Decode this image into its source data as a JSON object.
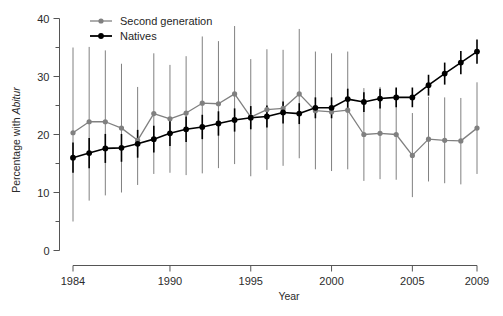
{
  "chart_data": {
    "type": "line",
    "title": "",
    "xlabel": "Year",
    "ylabel_prefix": "Percentage with ",
    "ylabel_italic": "Abitur",
    "xlim": [
      1983.2,
      2009.6
    ],
    "ylim": [
      0,
      40
    ],
    "grid": false,
    "legend_position": "top-left",
    "x_ticks": [
      1984,
      1990,
      1995,
      2000,
      2005,
      2009
    ],
    "x_tick_labels": [
      "1984",
      "1990",
      "1995",
      "2000",
      "2005",
      "2009"
    ],
    "y_ticks": [
      0,
      10,
      20,
      30,
      40
    ],
    "y_tick_labels": [
      "0",
      "10",
      "20",
      "30",
      "40"
    ],
    "y_minor_ticks": [
      5,
      15,
      25,
      35
    ],
    "x": [
      1984,
      1985,
      1986,
      1987,
      1988,
      1989,
      1990,
      1991,
      1992,
      1993,
      1994,
      1995,
      1996,
      1997,
      1998,
      1999,
      2000,
      2001,
      2002,
      2003,
      2004,
      2005,
      2006,
      2007,
      2008,
      2009
    ],
    "series": [
      {
        "name": "Second generation",
        "color": "#808080",
        "marker": "circle",
        "values": [
          20.3,
          22.2,
          22.2,
          21.1,
          19.0,
          23.6,
          22.7,
          23.7,
          25.4,
          25.3,
          27.0,
          23.0,
          24.3,
          24.5,
          27.0,
          24.1,
          23.9,
          24.2,
          20.0,
          20.2,
          20.0,
          16.4,
          19.2,
          19.0,
          18.9,
          21.1
        ],
        "ci_low": [
          5.0,
          8.6,
          9.5,
          10.0,
          11.3,
          13.2,
          13.4,
          13.0,
          13.3,
          14.2,
          14.9,
          12.8,
          13.9,
          14.6,
          15.9,
          14.0,
          13.7,
          14.0,
          12.0,
          12.3,
          12.2,
          9.2,
          11.9,
          11.6,
          11.4,
          13.2
        ],
        "ci_high": [
          35.0,
          35.1,
          34.5,
          32.2,
          28.2,
          34.0,
          32.0,
          33.5,
          36.9,
          36.1,
          38.7,
          33.0,
          34.7,
          34.6,
          38.2,
          34.3,
          34.0,
          34.3,
          28.0,
          28.2,
          27.9,
          23.7,
          26.5,
          26.4,
          26.3,
          29.0
        ]
      },
      {
        "name": "Natives",
        "color": "#000000",
        "marker": "circle",
        "values": [
          16.0,
          16.8,
          17.6,
          17.7,
          18.4,
          19.2,
          20.2,
          20.9,
          21.3,
          21.9,
          22.5,
          22.9,
          23.1,
          23.8,
          23.6,
          24.6,
          24.6,
          26.1,
          25.6,
          26.2,
          26.4,
          26.4,
          28.5,
          30.5,
          32.4,
          34.3
        ],
        "ci_low": [
          13.4,
          14.2,
          15.1,
          15.3,
          16.0,
          16.9,
          18.0,
          18.7,
          19.2,
          19.8,
          20.5,
          20.9,
          21.2,
          21.9,
          21.8,
          22.8,
          22.8,
          24.3,
          23.9,
          24.5,
          24.7,
          24.7,
          26.7,
          28.6,
          30.4,
          32.2
        ],
        "ci_high": [
          18.6,
          19.4,
          20.1,
          20.1,
          20.8,
          21.5,
          22.4,
          23.1,
          23.4,
          24.0,
          24.5,
          24.9,
          25.0,
          25.7,
          25.4,
          26.4,
          26.4,
          27.9,
          27.3,
          27.9,
          28.1,
          28.1,
          30.3,
          32.4,
          34.4,
          36.4
        ]
      }
    ],
    "legend": [
      {
        "label": "Second generation",
        "color": "#808080"
      },
      {
        "label": "Natives",
        "color": "#000000"
      }
    ]
  }
}
